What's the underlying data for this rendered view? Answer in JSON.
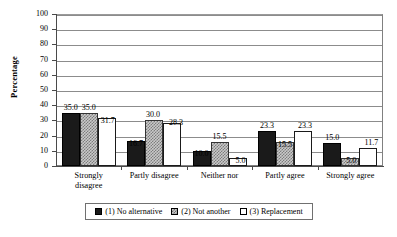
{
  "chart_data": {
    "type": "bar",
    "title": "",
    "subtitle": "",
    "xlabel": "",
    "ylabel": "Percentage",
    "ylim": [
      0,
      100
    ],
    "ytick_step": 10,
    "yticks": [
      "100",
      "90",
      "80",
      "70",
      "60",
      "50",
      "40",
      "30",
      "20",
      "10",
      "0"
    ],
    "grid": "horizontal",
    "legend_position": "bottom",
    "categories": [
      "Strongly\ndisagree",
      "Partly disagree",
      "Neither nor",
      "Partly agree",
      "Strongly agree"
    ],
    "series": [
      {
        "name": "(1) No alternative",
        "key": "s1",
        "fill": "solid-black",
        "values": [
          35.0,
          16.7,
          10.0,
          23.3,
          15.0
        ],
        "labels": [
          "35.0",
          "16.7",
          "10.0",
          "23.3",
          "15.0"
        ]
      },
      {
        "name": "(2) Not another",
        "key": "s2",
        "fill": "checkered-gray",
        "values": [
          35.0,
          30.0,
          15.5,
          15.5,
          5.0
        ],
        "labels": [
          "35.0",
          "30.0",
          "15.5",
          "15.5",
          "5.0"
        ]
      },
      {
        "name": "(3) Replacement",
        "key": "s3",
        "fill": "white-outline",
        "values": [
          31.7,
          28.3,
          5.0,
          23.3,
          11.7
        ],
        "labels": [
          "31.7",
          "28.3",
          "5.0",
          "23.3",
          "11.7"
        ]
      }
    ]
  },
  "legend": {
    "items": [
      {
        "label": "(1) No alternative",
        "swatch": "s1"
      },
      {
        "label": "(2) Not another",
        "swatch": "s2"
      },
      {
        "label": "(3) Replacement",
        "swatch": "s3"
      }
    ]
  },
  "axis": {
    "y_title": "Percentage"
  }
}
